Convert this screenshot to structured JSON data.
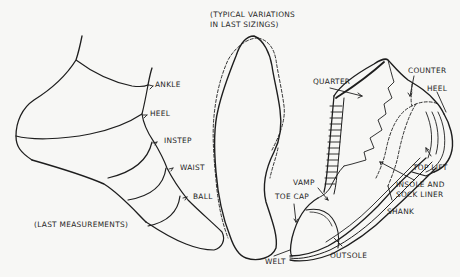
{
  "figure": {
    "ink_color": "#1e1e1e",
    "background_color": "#f7f7f5",
    "panels": [
      {
        "id": "last-measurements",
        "caption": "(LAST MEASUREMENTS)",
        "labels": {
          "ankle": "ANKLE",
          "heel": "HEEL",
          "instep": "INSTEP",
          "waist": "WAIST",
          "ball": "BALL"
        }
      },
      {
        "id": "last-sizings",
        "caption_line1": "(TYPICAL VARIATIONS",
        "caption_line2": "IN LAST SIZINGS)"
      },
      {
        "id": "shoe-parts",
        "labels": {
          "quarter": "QUARTER",
          "counter": "COUNTER",
          "heel": "HEEL",
          "top_lift": "TOP LIFT",
          "insole_line1": "INSOLE AND",
          "insole_line2": "SOCK LINER",
          "shank": "SHANK",
          "vamp": "VAMP",
          "toe_cap": "TOE CAP",
          "outsole": "OUTSOLE",
          "welt": "WELT"
        }
      }
    ]
  }
}
